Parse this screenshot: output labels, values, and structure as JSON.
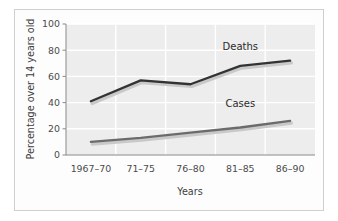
{
  "chart_data": {
    "type": "line",
    "title": "",
    "xlabel": "Years",
    "ylabel": "Percentage over 14 years old",
    "categories": [
      "1967–70",
      "71–75",
      "76–80",
      "81–85",
      "86–90"
    ],
    "ylim": [
      0,
      100
    ],
    "yticks": [
      0,
      20,
      40,
      60,
      80,
      100
    ],
    "ytick_labels": [
      "0",
      "20",
      "40",
      "60",
      "80",
      "100"
    ],
    "grid": true,
    "grid_color": "#ffffff",
    "plot_background": "#ededed",
    "legend": "inline-labels",
    "series": [
      {
        "name": "Deaths",
        "values": [
          41,
          57,
          54,
          68,
          72
        ],
        "color": "#333333",
        "label_x_category": "81–85",
        "label_value": 80
      },
      {
        "name": "Cases",
        "values": [
          10,
          13,
          17,
          21,
          26
        ],
        "color": "#6b6b6b",
        "label_x_category": "81–85",
        "label_value": 37
      }
    ]
  },
  "axes": {
    "y_axis_label": "Percentage over 14 years old",
    "x_axis_label": "Years",
    "y_tick_labels": [
      "100",
      "80",
      "60",
      "40",
      "20",
      "0"
    ],
    "x_tick_labels": [
      "1967–70",
      "71–75",
      "76–80",
      "81–85",
      "86–90"
    ]
  },
  "labels": {
    "deaths": "Deaths",
    "cases": "Cases"
  },
  "colors": {
    "deaths_line": "#333333",
    "cases_line": "#6b6b6b",
    "plot_bg": "#ededed",
    "gridline": "#ffffff",
    "axis": "#7a7a7a",
    "frame": "#cfcfcf",
    "text": "#4a4a4a"
  }
}
